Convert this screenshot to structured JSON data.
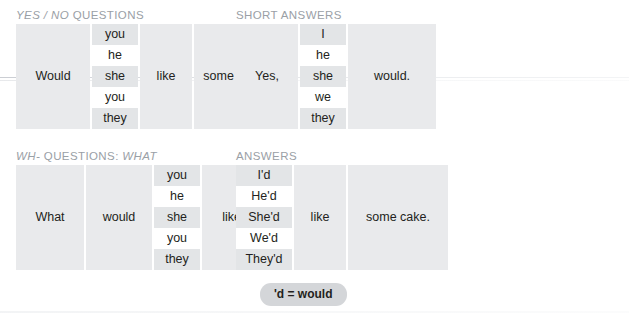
{
  "page": {
    "background": "#ffffff",
    "cell_bg": "#e9eaec",
    "cell_bg_alt": "#e3e5e7",
    "heading_color": "#9aa0a6",
    "text_color": "#231f20",
    "pill_bg": "#d4d6d9"
  },
  "panels": [
    {
      "id": "yes-no-questions",
      "title_parts": [
        {
          "text": "YES / NO",
          "style": "italic"
        },
        {
          "text": " QUESTIONS",
          "style": "upright"
        }
      ],
      "title_plain": "YES / NO QUESTIONS",
      "columns": [
        {
          "type": "single",
          "value": "Would"
        },
        {
          "type": "stack",
          "values": [
            "you",
            "he",
            "she",
            "you",
            "they"
          ]
        },
        {
          "type": "single",
          "value": "like"
        },
        {
          "type": "single",
          "value": "some cake?"
        }
      ]
    },
    {
      "id": "short-answers",
      "title_parts": [
        {
          "text": "SHORT ANSWERS",
          "style": "upright"
        }
      ],
      "title_plain": "SHORT ANSWERS",
      "columns": [
        {
          "type": "single",
          "value": "Yes,"
        },
        {
          "type": "stack",
          "values": [
            "I",
            "he",
            "she",
            "we",
            "they"
          ]
        },
        {
          "type": "single",
          "value": "would."
        }
      ]
    },
    {
      "id": "wh-questions-what",
      "title_parts": [
        {
          "text": "WH-",
          "style": "italic"
        },
        {
          "text": " QUESTIONS: ",
          "style": "upright"
        },
        {
          "text": "WHAT",
          "style": "italic"
        }
      ],
      "title_plain": "WH- QUESTIONS: WHAT",
      "columns": [
        {
          "type": "single",
          "value": "What"
        },
        {
          "type": "single",
          "value": "would"
        },
        {
          "type": "stack",
          "values": [
            "you",
            "he",
            "she",
            "you",
            "they"
          ]
        },
        {
          "type": "single",
          "value": "like?"
        }
      ]
    },
    {
      "id": "answers",
      "title_parts": [
        {
          "text": "ANSWERS",
          "style": "upright"
        }
      ],
      "title_plain": "ANSWERS",
      "columns": [
        {
          "type": "stack",
          "values": [
            "I'd",
            "He'd",
            "She'd",
            "We'd",
            "They'd"
          ]
        },
        {
          "type": "single",
          "value": "like"
        },
        {
          "type": "single",
          "value": "some cake."
        }
      ]
    }
  ],
  "note_pill": {
    "label": "'d = would"
  }
}
